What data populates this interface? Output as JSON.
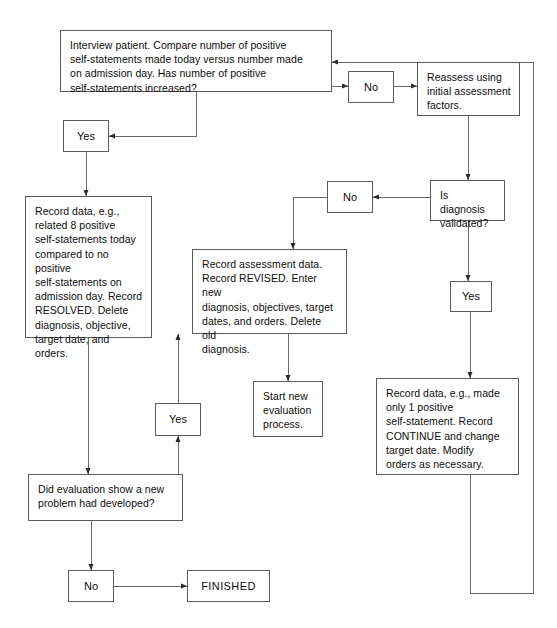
{
  "diagram": {
    "line_color": "#5b5b5b",
    "text_color": "#0d0d0d",
    "background": "#ffffff",
    "nodes": [
      {
        "id": "interview",
        "name": "interview-patient-box",
        "kind": "process",
        "text": "Interview patient. Compare number of positive\nself-statements made today versus number made\non admission day. Has number of positive\nself-statements increased?",
        "x": 60,
        "y": 30,
        "w": 272,
        "h": 62
      },
      {
        "id": "no-top",
        "name": "no-label-top",
        "kind": "label",
        "text": "No",
        "x": 348,
        "y": 71,
        "w": 46,
        "h": 32
      },
      {
        "id": "reassess",
        "name": "reassess-box",
        "kind": "process",
        "text": "Reassess using\ninitial assessment\nfactors.",
        "x": 417,
        "y": 62,
        "w": 103,
        "h": 54
      },
      {
        "id": "yes-top-left",
        "name": "yes-label-top-left",
        "kind": "label",
        "text": "Yes",
        "x": 63,
        "y": 120,
        "w": 46,
        "h": 32
      },
      {
        "id": "record-resolved",
        "name": "record-resolved-box",
        "kind": "process",
        "text": "Record data, e.g.,\nrelated 8 positive\nself-statements today\ncompared to no positive\nself-statements on\nadmission day. Record\nRESOLVED. Delete\ndiagnosis, objective,\ntarget date, and orders.",
        "x": 25,
        "y": 196,
        "w": 127,
        "h": 142
      },
      {
        "id": "no-mid",
        "name": "no-label-middle",
        "kind": "label",
        "text": "No",
        "x": 327,
        "y": 181,
        "w": 46,
        "h": 32
      },
      {
        "id": "is-diagnosis-validated",
        "name": "is-diagnosis-validated-box",
        "kind": "decision",
        "text": "Is diagnosis\nvalidated?",
        "x": 430,
        "y": 180,
        "w": 75,
        "h": 41
      },
      {
        "id": "record-revised",
        "name": "record-assessment-revised-box",
        "kind": "process",
        "text": "Record assessment data.\nRecord REVISED. Enter new\ndiagnosis, objectives, target\ndates, and orders. Delete old\ndiagnosis.",
        "x": 192,
        "y": 249,
        "w": 155,
        "h": 85
      },
      {
        "id": "yes-right",
        "name": "yes-label-right",
        "kind": "label",
        "text": "Yes",
        "x": 450,
        "y": 281,
        "w": 42,
        "h": 31
      },
      {
        "id": "start-new-eval",
        "name": "start-new-evaluation-box",
        "kind": "process",
        "text": "Start new\nevaluation\nprocess.",
        "x": 253,
        "y": 381,
        "w": 70,
        "h": 56
      },
      {
        "id": "record-continue",
        "name": "record-continue-box",
        "kind": "process",
        "text": "Record data, e.g., made\nonly 1 positive\nself-statement. Record\nCONTINUE and change\ntarget date. Modify\norders as necessary.",
        "x": 376,
        "y": 378,
        "w": 143,
        "h": 97
      },
      {
        "id": "yes-bottom-left",
        "name": "yes-label-bottom-left",
        "kind": "label",
        "text": "Yes",
        "x": 155,
        "y": 403,
        "w": 46,
        "h": 33
      },
      {
        "id": "did-evaluation",
        "name": "did-evaluation-show-new-problem-box",
        "kind": "decision",
        "text": "Did evaluation show a new\nproblem had developed?",
        "x": 28,
        "y": 474,
        "w": 155,
        "h": 47
      },
      {
        "id": "no-bottom",
        "name": "no-label-bottom",
        "kind": "label",
        "text": "No",
        "x": 68,
        "y": 570,
        "w": 46,
        "h": 32
      },
      {
        "id": "finished",
        "name": "finished-terminal",
        "kind": "terminal",
        "text": "FINISHED",
        "x": 187,
        "y": 570,
        "w": 83,
        "h": 32
      }
    ],
    "edges": [
      {
        "name": "edge-interview-to-no-top",
        "from": "interview",
        "to": "no-top"
      },
      {
        "name": "edge-no-top-to-reassess",
        "from": "no-top",
        "to": "reassess"
      },
      {
        "name": "edge-interview-to-yes-top-left",
        "from": "interview",
        "to": "yes-top-left"
      },
      {
        "name": "edge-yes-top-left-to-record-resolved",
        "from": "yes-top-left",
        "to": "record-resolved"
      },
      {
        "name": "edge-reassess-to-is-diagnosis-validated",
        "from": "reassess",
        "to": "is-diagnosis-validated"
      },
      {
        "name": "edge-is-diagnosis-validated-to-no-mid",
        "from": "is-diagnosis-validated",
        "to": "no-mid"
      },
      {
        "name": "edge-no-mid-to-record-revised",
        "from": "no-mid",
        "to": "record-revised"
      },
      {
        "name": "edge-is-diagnosis-validated-to-yes-right",
        "from": "is-diagnosis-validated",
        "to": "yes-right"
      },
      {
        "name": "edge-yes-right-to-record-continue",
        "from": "yes-right",
        "to": "record-continue"
      },
      {
        "name": "edge-record-revised-to-start-new-eval",
        "from": "record-revised",
        "to": "start-new-eval"
      },
      {
        "name": "edge-record-resolved-to-did-evaluation",
        "from": "record-resolved",
        "to": "did-evaluation"
      },
      {
        "name": "edge-did-evaluation-to-yes-bottom-left",
        "from": "did-evaluation",
        "to": "yes-bottom-left"
      },
      {
        "name": "edge-yes-bottom-left-to-record-revised",
        "from": "yes-bottom-left",
        "to": "record-revised"
      },
      {
        "name": "edge-did-evaluation-to-no-bottom",
        "from": "did-evaluation",
        "to": "no-bottom"
      },
      {
        "name": "edge-no-bottom-to-finished",
        "from": "no-bottom",
        "to": "finished"
      },
      {
        "name": "edge-record-continue-loopback-to-interview",
        "from": "record-continue",
        "to": "interview"
      }
    ]
  }
}
